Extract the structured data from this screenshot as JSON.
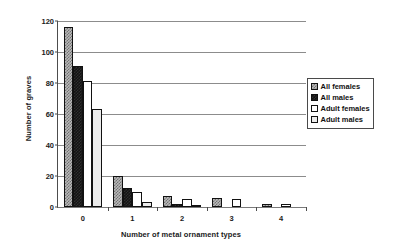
{
  "chart_data": {
    "type": "bar",
    "title": "",
    "xlabel": "Number of metal ornament types",
    "ylabel": "Number of graves",
    "categories": [
      "0",
      "1",
      "2",
      "3",
      "4"
    ],
    "ylim": [
      0,
      120
    ],
    "yticks": [
      0,
      20,
      40,
      60,
      80,
      100,
      120
    ],
    "grid": true,
    "legend_position": "right",
    "series": [
      {
        "name": "All females",
        "values": [
          116,
          20,
          7,
          6,
          2
        ],
        "swatch": "gray-checker"
      },
      {
        "name": "All males",
        "values": [
          91,
          12,
          2,
          0,
          0
        ],
        "swatch": "solid-black"
      },
      {
        "name": "Adult females",
        "values": [
          81,
          10,
          5,
          5,
          2
        ],
        "swatch": "white"
      },
      {
        "name": "Adult males",
        "values": [
          63,
          3,
          1,
          0,
          0
        ],
        "swatch": "light-gray"
      }
    ]
  },
  "axes": {
    "ylabel": "Number of graves",
    "xlabel": "Number of metal ornament types",
    "ytick_labels": [
      "0",
      "20",
      "40",
      "60",
      "80",
      "100",
      "120"
    ],
    "xtick_labels": [
      "0",
      "1",
      "2",
      "3",
      "4"
    ]
  },
  "legend": {
    "items": [
      {
        "label": "All females"
      },
      {
        "label": "All males"
      },
      {
        "label": "Adult females"
      },
      {
        "label": "Adult males"
      }
    ]
  },
  "colors": {
    "axis": "#4d4d4d",
    "gridline": "#8c8c8c",
    "bar_all_females": "#b9b9b9",
    "bar_all_males": "#141414",
    "bar_adult_females": "#ffffff",
    "bar_adult_males": "#ebebeb",
    "bar_outline": "#111111",
    "text": "#1a1a1a"
  }
}
